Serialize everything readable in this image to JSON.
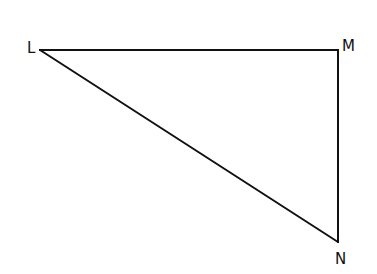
{
  "diagram": {
    "type": "right-triangle",
    "stroke_color": "#111111",
    "background": "#ffffff",
    "vertices": [
      {
        "id": "L",
        "label": "L",
        "x": 40,
        "y": 50,
        "label_x": 27,
        "label_y": 53
      },
      {
        "id": "M",
        "label": "M",
        "x": 338,
        "y": 50,
        "label_x": 342,
        "label_y": 51
      },
      {
        "id": "N",
        "label": "N",
        "x": 338,
        "y": 242,
        "label_x": 335,
        "label_y": 264
      }
    ],
    "sides": [
      {
        "name": "LM",
        "from": "L",
        "to": "M"
      },
      {
        "name": "MN",
        "from": "M",
        "to": "N"
      },
      {
        "name": "NL",
        "from": "N",
        "to": "L"
      }
    ],
    "right_angle_at": "M"
  }
}
